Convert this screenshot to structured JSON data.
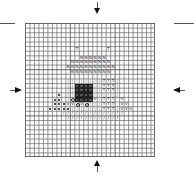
{
  "chart_data": {
    "type": "cross-stitch-pattern",
    "title": "",
    "grid": {
      "cols": 29,
      "rows": 29
    },
    "colors": {
      "grid_line": "#777777",
      "grid_major": "#444444",
      "dark_fill": "#222222",
      "circle_fill": "#bbbbbb"
    },
    "center_markers": [
      "top-arrow",
      "bottom-arrow",
      "left-arrow",
      "right-arrow"
    ],
    "symbols": {
      "T": "T",
      "N": "N",
      "V": "V",
      "slash": "/",
      "dot": "dot",
      "circle": "filled-circle",
      "dark": "dark-square",
      "ring": "open-circle",
      "bar": "|"
    },
    "cells": [
      {
        "r": 5,
        "c": 11,
        "s": "T"
      },
      {
        "r": 5,
        "c": 18,
        "s": "T"
      },
      {
        "r": 6,
        "c": 10,
        "s": "circle"
      },
      {
        "r": 6,
        "c": 11,
        "s": "circle"
      },
      {
        "r": 6,
        "c": 12,
        "s": "circle"
      },
      {
        "r": 6,
        "c": 13,
        "s": "circle"
      },
      {
        "r": 6,
        "c": 14,
        "s": "circle"
      },
      {
        "r": 6,
        "c": 15,
        "s": "circle"
      },
      {
        "r": 6,
        "c": 16,
        "s": "circle"
      },
      {
        "r": 6,
        "c": 17,
        "s": "circle"
      },
      {
        "r": 6,
        "c": 18,
        "s": "circle"
      },
      {
        "r": 6,
        "c": 19,
        "s": "circle"
      },
      {
        "r": 7,
        "c": 9,
        "s": "circle"
      },
      {
        "r": 7,
        "c": 10,
        "s": "circle"
      },
      {
        "r": 7,
        "c": 11,
        "s": "circle"
      },
      {
        "r": 7,
        "c": 12,
        "s": "N"
      },
      {
        "r": 7,
        "c": 13,
        "s": "N"
      },
      {
        "r": 7,
        "c": 14,
        "s": "N"
      },
      {
        "r": 7,
        "c": 15,
        "s": "N"
      },
      {
        "r": 7,
        "c": 16,
        "s": "N"
      },
      {
        "r": 7,
        "c": 17,
        "s": "N"
      },
      {
        "r": 7,
        "c": 18,
        "s": "circle"
      },
      {
        "r": 7,
        "c": 19,
        "s": "circle"
      },
      {
        "r": 7,
        "c": 20,
        "s": "circle"
      },
      {
        "r": 8,
        "c": 7,
        "s": "circle"
      },
      {
        "r": 8,
        "c": 8,
        "s": "circle"
      },
      {
        "r": 8,
        "c": 9,
        "s": "circle"
      },
      {
        "r": 8,
        "c": 10,
        "s": "N"
      },
      {
        "r": 8,
        "c": 11,
        "s": "N"
      },
      {
        "r": 8,
        "c": 12,
        "s": "N"
      },
      {
        "r": 8,
        "c": 13,
        "s": "N"
      },
      {
        "r": 8,
        "c": 14,
        "s": "N"
      },
      {
        "r": 8,
        "c": 15,
        "s": "N"
      },
      {
        "r": 8,
        "c": 16,
        "s": "N"
      },
      {
        "r": 8,
        "c": 17,
        "s": "N"
      },
      {
        "r": 8,
        "c": 18,
        "s": "N"
      },
      {
        "r": 8,
        "c": 19,
        "s": "circle"
      },
      {
        "r": 8,
        "c": 20,
        "s": "circle"
      },
      {
        "r": 8,
        "c": 21,
        "s": "circle"
      },
      {
        "r": 9,
        "c": 7,
        "s": "circle"
      },
      {
        "r": 9,
        "c": 8,
        "s": "circle"
      },
      {
        "r": 9,
        "c": 9,
        "s": "N"
      },
      {
        "r": 9,
        "c": 10,
        "s": "N"
      },
      {
        "r": 9,
        "c": 11,
        "s": "N"
      },
      {
        "r": 9,
        "c": 12,
        "s": "N"
      },
      {
        "r": 9,
        "c": 13,
        "s": "N"
      },
      {
        "r": 9,
        "c": 14,
        "s": "N"
      },
      {
        "r": 9,
        "c": 15,
        "s": "N"
      },
      {
        "r": 9,
        "c": 16,
        "s": "N"
      },
      {
        "r": 9,
        "c": 17,
        "s": "N"
      },
      {
        "r": 9,
        "c": 18,
        "s": "N"
      },
      {
        "r": 9,
        "c": 19,
        "s": "N"
      },
      {
        "r": 9,
        "c": 20,
        "s": "circle"
      },
      {
        "r": 9,
        "c": 21,
        "s": "circle"
      },
      {
        "r": 9,
        "c": 22,
        "s": "circle"
      },
      {
        "r": 10,
        "c": 7,
        "s": "circle"
      },
      {
        "r": 10,
        "c": 8,
        "s": "circle"
      },
      {
        "r": 10,
        "c": 9,
        "s": "circle"
      },
      {
        "r": 10,
        "c": 10,
        "s": "N"
      },
      {
        "r": 10,
        "c": 11,
        "s": "N"
      },
      {
        "r": 10,
        "c": 12,
        "s": "N"
      },
      {
        "r": 10,
        "c": 13,
        "s": "N"
      },
      {
        "r": 10,
        "c": 14,
        "s": "N"
      },
      {
        "r": 10,
        "c": 15,
        "s": "N"
      },
      {
        "r": 10,
        "c": 16,
        "s": "N"
      },
      {
        "r": 10,
        "c": 17,
        "s": "N"
      },
      {
        "r": 10,
        "c": 18,
        "s": "N"
      },
      {
        "r": 10,
        "c": 19,
        "s": "circle"
      },
      {
        "r": 10,
        "c": 20,
        "s": "circle"
      },
      {
        "r": 10,
        "c": 21,
        "s": "circle"
      },
      {
        "r": 10,
        "c": 22,
        "s": "circle"
      },
      {
        "r": 11,
        "c": 7,
        "s": "circle"
      },
      {
        "r": 11,
        "c": 8,
        "s": "circle"
      },
      {
        "r": 11,
        "c": 9,
        "s": "circle"
      },
      {
        "r": 11,
        "c": 10,
        "s": "circle"
      },
      {
        "r": 11,
        "c": 11,
        "s": "circle"
      },
      {
        "r": 11,
        "c": 12,
        "s": "circle"
      },
      {
        "r": 11,
        "c": 13,
        "s": "circle"
      },
      {
        "r": 11,
        "c": 14,
        "s": "circle"
      },
      {
        "r": 11,
        "c": 15,
        "s": "circle"
      },
      {
        "r": 11,
        "c": 16,
        "s": "circle"
      },
      {
        "r": 11,
        "c": 17,
        "s": "circle"
      },
      {
        "r": 11,
        "c": 18,
        "s": "circle"
      },
      {
        "r": 11,
        "c": 19,
        "s": "circle"
      },
      {
        "r": 11,
        "c": 20,
        "s": "circle"
      },
      {
        "r": 11,
        "c": 21,
        "s": "circle"
      },
      {
        "r": 11,
        "c": 22,
        "s": "circle"
      },
      {
        "r": 12,
        "c": 9,
        "s": "bar"
      },
      {
        "r": 12,
        "c": 10,
        "s": "bar"
      },
      {
        "r": 12,
        "c": 11,
        "s": "bar"
      },
      {
        "r": 12,
        "c": 12,
        "s": "bar"
      },
      {
        "r": 12,
        "c": 13,
        "s": "bar"
      },
      {
        "r": 12,
        "c": 14,
        "s": "bar"
      },
      {
        "r": 12,
        "c": 15,
        "s": "bar"
      },
      {
        "r": 12,
        "c": 16,
        "s": "bar"
      },
      {
        "r": 12,
        "c": 17,
        "s": "T"
      },
      {
        "r": 12,
        "c": 18,
        "s": "T"
      },
      {
        "r": 12,
        "c": 19,
        "s": "T"
      },
      {
        "r": 12,
        "c": 20,
        "s": "bar"
      },
      {
        "r": 13,
        "c": 9,
        "s": "bar"
      },
      {
        "r": 13,
        "c": 10,
        "s": "bar"
      },
      {
        "r": 13,
        "c": 11,
        "s": "dark"
      },
      {
        "r": 13,
        "c": 12,
        "s": "dark"
      },
      {
        "r": 13,
        "c": 13,
        "s": "dark"
      },
      {
        "r": 13,
        "c": 14,
        "s": "dark"
      },
      {
        "r": 13,
        "c": 15,
        "s": "bar"
      },
      {
        "r": 13,
        "c": 16,
        "s": "bar"
      },
      {
        "r": 13,
        "c": 17,
        "s": "T"
      },
      {
        "r": 13,
        "c": 18,
        "s": "T"
      },
      {
        "r": 13,
        "c": 19,
        "s": "T"
      },
      {
        "r": 13,
        "c": 20,
        "s": "bar"
      },
      {
        "r": 14,
        "c": 9,
        "s": "bar"
      },
      {
        "r": 14,
        "c": 10,
        "s": "bar"
      },
      {
        "r": 14,
        "c": 11,
        "s": "dark"
      },
      {
        "r": 14,
        "c": 12,
        "s": "dark"
      },
      {
        "r": 14,
        "c": 13,
        "s": "dark"
      },
      {
        "r": 14,
        "c": 14,
        "s": "dark"
      },
      {
        "r": 14,
        "c": 15,
        "s": "bar"
      },
      {
        "r": 14,
        "c": 16,
        "s": "bar"
      },
      {
        "r": 14,
        "c": 17,
        "s": "T"
      },
      {
        "r": 14,
        "c": 18,
        "s": "T"
      },
      {
        "r": 14,
        "c": 19,
        "s": "T"
      },
      {
        "r": 14,
        "c": 20,
        "s": "bar"
      },
      {
        "r": 15,
        "c": 7,
        "s": "dot"
      },
      {
        "r": 15,
        "c": 9,
        "s": "bar"
      },
      {
        "r": 15,
        "c": 10,
        "s": "bar"
      },
      {
        "r": 15,
        "c": 11,
        "s": "dark"
      },
      {
        "r": 15,
        "c": 12,
        "s": "dark"
      },
      {
        "r": 15,
        "c": 13,
        "s": "dark"
      },
      {
        "r": 15,
        "c": 14,
        "s": "dark"
      },
      {
        "r": 15,
        "c": 15,
        "s": "bar"
      },
      {
        "r": 15,
        "c": 16,
        "s": "bar"
      },
      {
        "r": 15,
        "c": 17,
        "s": "bar"
      },
      {
        "r": 15,
        "c": 18,
        "s": "bar"
      },
      {
        "r": 15,
        "c": 19,
        "s": "bar"
      },
      {
        "r": 15,
        "c": 20,
        "s": "bar"
      },
      {
        "r": 16,
        "c": 6,
        "s": "dot"
      },
      {
        "r": 16,
        "c": 7,
        "s": "dot"
      },
      {
        "r": 16,
        "c": 9,
        "s": "bar"
      },
      {
        "r": 16,
        "c": 10,
        "s": "ring"
      },
      {
        "r": 16,
        "c": 11,
        "s": "dark"
      },
      {
        "r": 16,
        "c": 12,
        "s": "dark"
      },
      {
        "r": 16,
        "c": 13,
        "s": "dark"
      },
      {
        "r": 16,
        "c": 14,
        "s": "dark"
      },
      {
        "r": 16,
        "c": 15,
        "s": "V"
      },
      {
        "r": 16,
        "c": 16,
        "s": "bar"
      },
      {
        "r": 16,
        "c": 17,
        "s": "T"
      },
      {
        "r": 16,
        "c": 18,
        "s": "T"
      },
      {
        "r": 16,
        "c": 19,
        "s": "T"
      },
      {
        "r": 16,
        "c": 21,
        "s": "V"
      },
      {
        "r": 17,
        "c": 6,
        "s": "dot"
      },
      {
        "r": 17,
        "c": 7,
        "s": "dot"
      },
      {
        "r": 17,
        "c": 8,
        "s": "dot"
      },
      {
        "r": 17,
        "c": 9,
        "s": "V"
      },
      {
        "r": 17,
        "c": 10,
        "s": "V"
      },
      {
        "r": 17,
        "c": 11,
        "s": "ring"
      },
      {
        "r": 17,
        "c": 12,
        "s": "V"
      },
      {
        "r": 17,
        "c": 13,
        "s": "ring"
      },
      {
        "r": 17,
        "c": 14,
        "s": "bar"
      },
      {
        "r": 17,
        "c": 15,
        "s": "bar"
      },
      {
        "r": 17,
        "c": 16,
        "s": "bar"
      },
      {
        "r": 17,
        "c": 17,
        "s": "T"
      },
      {
        "r": 17,
        "c": 18,
        "s": "T"
      },
      {
        "r": 17,
        "c": 19,
        "s": "T"
      },
      {
        "r": 17,
        "c": 21,
        "s": "V"
      },
      {
        "r": 17,
        "c": 22,
        "s": "V"
      },
      {
        "r": 18,
        "c": 5,
        "s": "dot"
      },
      {
        "r": 18,
        "c": 6,
        "s": "dot"
      },
      {
        "r": 18,
        "c": 7,
        "s": "dot"
      },
      {
        "r": 18,
        "c": 8,
        "s": "dot"
      },
      {
        "r": 18,
        "c": 9,
        "s": "dot"
      },
      {
        "r": 18,
        "c": 10,
        "s": "bar"
      },
      {
        "r": 18,
        "c": 11,
        "s": "bar"
      },
      {
        "r": 18,
        "c": 12,
        "s": "bar"
      },
      {
        "r": 18,
        "c": 13,
        "s": "bar"
      },
      {
        "r": 18,
        "c": 14,
        "s": "bar"
      },
      {
        "r": 18,
        "c": 15,
        "s": "bar"
      },
      {
        "r": 18,
        "c": 16,
        "s": "bar"
      },
      {
        "r": 18,
        "c": 17,
        "s": "T"
      },
      {
        "r": 18,
        "c": 18,
        "s": "T"
      },
      {
        "r": 18,
        "c": 19,
        "s": "T"
      },
      {
        "r": 18,
        "c": 20,
        "s": "bar"
      },
      {
        "r": 18,
        "c": 21,
        "s": "V"
      },
      {
        "r": 18,
        "c": 22,
        "s": "V"
      },
      {
        "r": 18,
        "c": 23,
        "s": "V"
      },
      {
        "r": 19,
        "c": 8,
        "s": "slash"
      },
      {
        "r": 19,
        "c": 9,
        "s": "slash"
      },
      {
        "r": 19,
        "c": 10,
        "s": "slash"
      },
      {
        "r": 19,
        "c": 11,
        "s": "slash"
      },
      {
        "r": 19,
        "c": 12,
        "s": "slash"
      },
      {
        "r": 19,
        "c": 13,
        "s": "slash"
      },
      {
        "r": 19,
        "c": 14,
        "s": "slash"
      },
      {
        "r": 19,
        "c": 15,
        "s": "slash"
      },
      {
        "r": 19,
        "c": 16,
        "s": "slash"
      },
      {
        "r": 19,
        "c": 17,
        "s": "slash"
      },
      {
        "r": 19,
        "c": 18,
        "s": "slash"
      },
      {
        "r": 19,
        "c": 19,
        "s": "slash"
      },
      {
        "r": 19,
        "c": 20,
        "s": "slash"
      },
      {
        "r": 19,
        "c": 21,
        "s": "slash"
      },
      {
        "r": 20,
        "c": 9,
        "s": "slash"
      },
      {
        "r": 20,
        "c": 10,
        "s": "slash"
      },
      {
        "r": 20,
        "c": 11,
        "s": "slash"
      },
      {
        "r": 20,
        "c": 12,
        "s": "slash"
      },
      {
        "r": 20,
        "c": 13,
        "s": "slash"
      },
      {
        "r": 20,
        "c": 14,
        "s": "slash"
      },
      {
        "r": 20,
        "c": 15,
        "s": "slash"
      },
      {
        "r": 20,
        "c": 16,
        "s": "slash"
      },
      {
        "r": 20,
        "c": 17,
        "s": "slash"
      },
      {
        "r": 20,
        "c": 18,
        "s": "slash"
      },
      {
        "r": 20,
        "c": 19,
        "s": "slash"
      },
      {
        "r": 20,
        "c": 20,
        "s": "slash"
      }
    ]
  }
}
